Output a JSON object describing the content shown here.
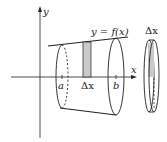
{
  "diagram": {
    "labels": {
      "y_axis": "y",
      "x_axis": "x",
      "curve": "y = f(x)",
      "a": "a",
      "b": "b",
      "delta_x": "Δx",
      "disk_delta_x": "Δx"
    },
    "colors": {
      "line": "#222222",
      "shade": "#cccccc"
    }
  }
}
